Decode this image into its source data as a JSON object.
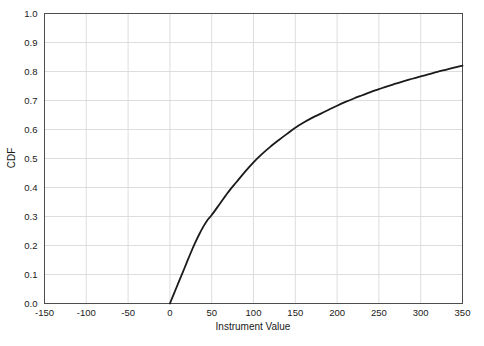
{
  "chart_data": {
    "type": "line",
    "title": "",
    "xlabel": "Instrument Value",
    "ylabel": "CDF",
    "xlim": [
      -150,
      350
    ],
    "ylim": [
      0.0,
      1.0
    ],
    "grid": true,
    "legend": null,
    "xticks": [
      -150,
      -100,
      -50,
      0,
      50,
      100,
      150,
      200,
      250,
      300,
      350
    ],
    "xtick_labels": [
      "-150",
      "-100",
      "-50",
      "0",
      "50",
      "100",
      "150",
      "200",
      "250",
      "300",
      "350"
    ],
    "yticks": [
      0.0,
      0.1,
      0.2,
      0.3,
      0.4,
      0.5,
      0.6,
      0.7,
      0.8,
      0.9,
      1.0
    ],
    "ytick_labels": [
      "0.0",
      "0.1",
      "0.2",
      "0.3",
      "0.4",
      "0.5",
      "0.6",
      "0.7",
      "0.8",
      "0.9",
      "1.0"
    ],
    "series": [
      {
        "name": "CDF",
        "color": "#1a1a1a",
        "linewidth": 1.8,
        "x": [
          0,
          5,
          10,
          15,
          20,
          25,
          30,
          35,
          40,
          45,
          50,
          60,
          70,
          80,
          90,
          100,
          110,
          120,
          130,
          140,
          150,
          160,
          170,
          180,
          190,
          200,
          210,
          220,
          230,
          240,
          250,
          260,
          270,
          280,
          290,
          300,
          310,
          320,
          330,
          340,
          350
        ],
        "values": [
          0.0,
          0.035,
          0.07,
          0.105,
          0.14,
          0.175,
          0.208,
          0.238,
          0.265,
          0.288,
          0.305,
          0.345,
          0.385,
          0.42,
          0.455,
          0.487,
          0.515,
          0.54,
          0.563,
          0.585,
          0.606,
          0.624,
          0.64,
          0.654,
          0.668,
          0.682,
          0.695,
          0.707,
          0.718,
          0.729,
          0.739,
          0.749,
          0.758,
          0.767,
          0.775,
          0.783,
          0.791,
          0.799,
          0.806,
          0.813,
          0.82
        ]
      }
    ]
  },
  "style": {
    "background": "#ffffff",
    "grid_color": "#d9d9d9",
    "axis_color": "#4d4d4d",
    "text_color": "#1a1a1a"
  }
}
